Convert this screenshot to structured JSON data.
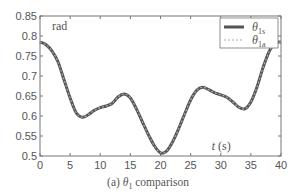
{
  "chart_data": {
    "type": "line",
    "title": "",
    "caption_prefix": "(a) ",
    "caption_symbol": "θ",
    "caption_sub": "1",
    "caption_suffix": " comparison",
    "xlabel_var": "t",
    "xlabel_unit": " (s)",
    "ylabel": "rad",
    "xlim": [
      0,
      40
    ],
    "ylim": [
      0.5,
      0.85
    ],
    "xticks": [
      0,
      5,
      10,
      15,
      20,
      25,
      30,
      35,
      40
    ],
    "yticks": [
      0.5,
      0.55,
      0.6,
      0.65,
      0.7,
      0.75,
      0.8,
      0.85
    ],
    "ytick_labels": [
      "0.5",
      "0.55",
      "0.6",
      "0.65",
      "0.7",
      "0.75",
      "0.8",
      "0.85"
    ],
    "grid": false,
    "legend_position": "upper right",
    "x": [
      0,
      1,
      2,
      3,
      4,
      5,
      6,
      7,
      8,
      9,
      10,
      11,
      12,
      13,
      14,
      15,
      16,
      17,
      18,
      19,
      20,
      21,
      22,
      23,
      24,
      25,
      26,
      27,
      28,
      29,
      30,
      31,
      32,
      33,
      34,
      35,
      36,
      37,
      38,
      39,
      40
    ],
    "series": [
      {
        "name": "θ1s",
        "symbol": "θ",
        "sub": "1s",
        "style": "solid",
        "color": "#555555",
        "values": [
          0.785,
          0.778,
          0.762,
          0.735,
          0.69,
          0.645,
          0.608,
          0.597,
          0.603,
          0.614,
          0.621,
          0.625,
          0.632,
          0.648,
          0.655,
          0.645,
          0.618,
          0.585,
          0.553,
          0.525,
          0.508,
          0.512,
          0.535,
          0.568,
          0.605,
          0.64,
          0.664,
          0.672,
          0.666,
          0.658,
          0.653,
          0.647,
          0.635,
          0.622,
          0.618,
          0.635,
          0.672,
          0.72,
          0.76,
          0.782,
          0.785
        ]
      },
      {
        "name": "θ1a",
        "symbol": "θ",
        "sub": "1a",
        "style": "dashed",
        "color": "#aaaaaa",
        "values": [
          0.785,
          0.778,
          0.762,
          0.735,
          0.69,
          0.645,
          0.608,
          0.597,
          0.603,
          0.614,
          0.621,
          0.625,
          0.632,
          0.648,
          0.655,
          0.645,
          0.618,
          0.585,
          0.553,
          0.525,
          0.508,
          0.512,
          0.535,
          0.568,
          0.605,
          0.64,
          0.664,
          0.672,
          0.666,
          0.658,
          0.653,
          0.647,
          0.635,
          0.622,
          0.618,
          0.635,
          0.672,
          0.72,
          0.76,
          0.782,
          0.785
        ]
      }
    ]
  },
  "plot_area": {
    "left": 40,
    "top": 16,
    "right": 281,
    "bottom": 156
  }
}
